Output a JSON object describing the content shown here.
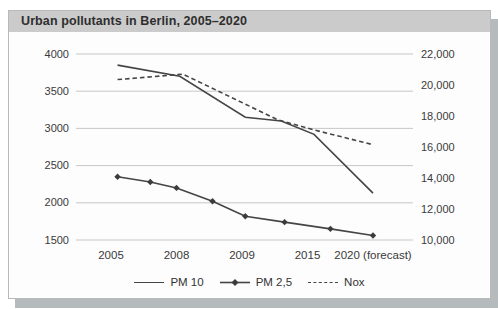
{
  "figure": {
    "title": "Urban pollutants in Berlin, 2005–2020"
  },
  "chart_data": {
    "type": "line",
    "title": "Urban pollutants in Berlin, 2005–2020",
    "x_categories": [
      "2005",
      "2008",
      "2009",
      "2015",
      "2020 (forecast)"
    ],
    "grid": "horizontal-only",
    "left_axis": {
      "min": 1500,
      "max": 4000,
      "ticks": [
        4000,
        3500,
        3000,
        2500,
        2000,
        1500
      ],
      "tick_labels": [
        "4000",
        "3500",
        "3000",
        "2500",
        "2000",
        "1500"
      ]
    },
    "right_axis": {
      "min": 10000,
      "max": 22000,
      "ticks": [
        22000,
        20000,
        18000,
        16000,
        14000,
        12000,
        10000
      ],
      "tick_labels": [
        "22,000",
        "20,000",
        "18,000",
        "16,000",
        "14,000",
        "12,000",
        "10,000"
      ]
    },
    "legend": {
      "position": "bottom",
      "entries": [
        "PM 10",
        "PM 2,5",
        "Nox"
      ]
    },
    "series": [
      {
        "name": "PM 10",
        "axis": "left",
        "style": "solid",
        "marker": "none",
        "points": [
          {
            "x": 0.1,
            "v": 3850
          },
          {
            "x": 1.05,
            "v": 3700
          },
          {
            "x": 2.05,
            "v": 3150
          },
          {
            "x": 2.6,
            "v": 3100
          },
          {
            "x": 3.1,
            "v": 2920
          },
          {
            "x": 4.0,
            "v": 2130
          }
        ]
      },
      {
        "name": "PM 2,5",
        "axis": "left",
        "style": "solid",
        "marker": "diamond",
        "points": [
          {
            "x": 0.1,
            "v": 2350
          },
          {
            "x": 0.6,
            "v": 2280
          },
          {
            "x": 1.0,
            "v": 2200
          },
          {
            "x": 1.55,
            "v": 2020
          },
          {
            "x": 2.05,
            "v": 1820
          },
          {
            "x": 2.65,
            "v": 1740
          },
          {
            "x": 3.35,
            "v": 1650
          },
          {
            "x": 4.0,
            "v": 1560
          }
        ]
      },
      {
        "name": "Nox",
        "axis": "right",
        "style": "dashed",
        "marker": "none",
        "points": [
          {
            "x": 0.1,
            "v": 20350
          },
          {
            "x": 1.1,
            "v": 20700
          },
          {
            "x": 2.55,
            "v": 17750
          },
          {
            "x": 3.1,
            "v": 17100
          },
          {
            "x": 4.0,
            "v": 16150
          }
        ]
      }
    ]
  },
  "colors": {
    "line": "#454545",
    "gridline": "#c7c7c7",
    "axis_text": "#3a3a3a",
    "titlebar_bg": "#cbcbcb",
    "figure_shadow": "#b5babc",
    "figure_bg": "#fdfdfd"
  }
}
